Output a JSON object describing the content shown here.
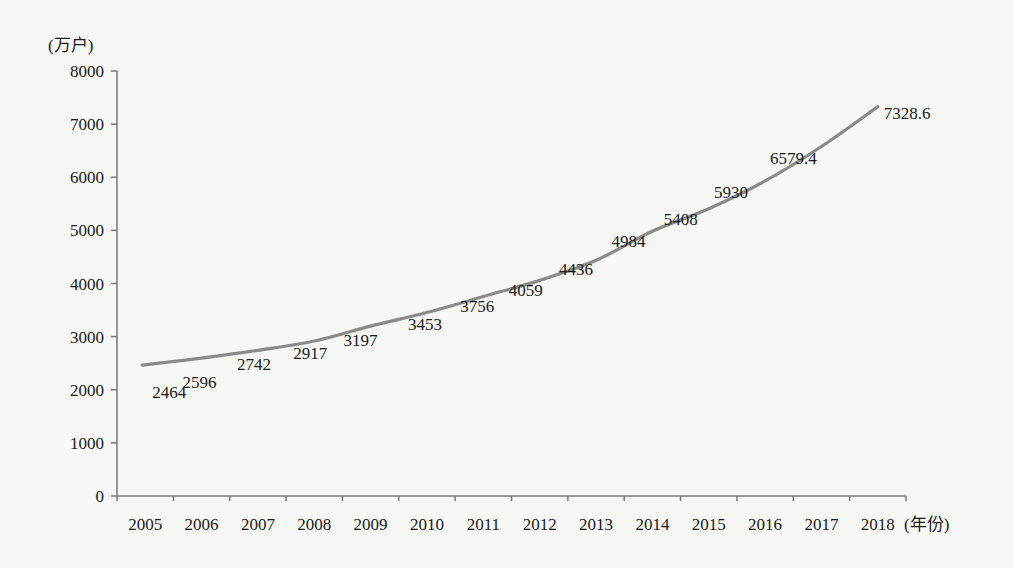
{
  "chart_data": {
    "type": "line",
    "title": "",
    "xlabel": "(年份)",
    "ylabel": "(万户)",
    "categories": [
      "2005",
      "2006",
      "2007",
      "2008",
      "2009",
      "2010",
      "2011",
      "2012",
      "2013",
      "2014",
      "2015",
      "2016",
      "2017",
      "2018"
    ],
    "series": [
      {
        "name": "",
        "values": [
          2464,
          2596,
          2742,
          2917,
          3197,
          3453,
          3756,
          4059,
          4436,
          4984,
          5408,
          5930,
          6579.4,
          7328.6
        ],
        "labels": [
          "2464",
          "2596",
          "2742",
          "2917",
          "3197",
          "3453",
          "3756",
          "4059",
          "4436",
          "4984",
          "5408",
          "5930",
          "6579.4",
          "7328.6"
        ],
        "color": "#8a8a8a"
      }
    ],
    "ylim": [
      0,
      8000
    ],
    "yticks": [
      0,
      1000,
      2000,
      3000,
      4000,
      5000,
      6000,
      7000,
      8000
    ],
    "ytick_labels": [
      "0",
      "1000",
      "2000",
      "3000",
      "4000",
      "5000",
      "6000",
      "7000",
      "8000"
    ],
    "grid": false,
    "legend": "none"
  },
  "colors": {
    "background": "#f7f7f5",
    "axis": "#7a7a7a",
    "line": "#8a8a8a",
    "text": "#1a1a1a"
  }
}
